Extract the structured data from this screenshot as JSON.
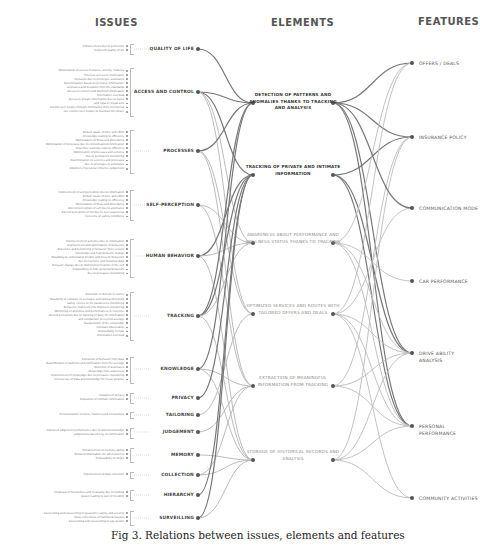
{
  "headers": {
    "issues": "ISSUES",
    "elements": "ELEMENTS",
    "features": "FEATURES"
  },
  "issues": [
    {
      "category": "QUALITY OF LIFE",
      "items": [
        "Enhancement due to perfection",
        "Improved quality of life"
      ]
    },
    {
      "category": "ACCESS AND CONTROL",
      "items": [
        "Optimization of access to places, activity, features",
        "Timeless access to information",
        "Exclusion due to privileges, anomalies",
        "Discrimination based on personal information,",
        "anomalies and deviation from the standards",
        "Access to content and distorted information",
        "Information overload",
        "Access to private information due to hacks",
        "and legal or illegal acts",
        "Control over people through information from monitoring",
        "Use control over people to maintain the power"
      ]
    },
    {
      "category": "PROCESSES",
      "items": [
        "Reduct waste of time and effort",
        "Knowledge leading to efficiency",
        "Optimization of flows and procedures",
        "Optimization of processes due to contextualized information",
        "Real time learning leads to efficiency",
        "Optimization of processes and services",
        "due to permanent monitoring",
        "Discrimination on services and processes",
        "due to privileges or anomalies",
        "Abolition of personal reflective judgement"
      ]
    },
    {
      "category": "SELF-PERCEPTION",
      "items": [
        "Improvement of self-perception due to information",
        "Reduct waste of time and effort",
        "Knowledge leading to efficiency",
        "Optimization of flows and procedures",
        "Altered perception of self due to anomalies",
        "Altered perception of life due to over awareness",
        "Concerns on safety conditions"
      ]
    },
    {
      "category": "HUMAN BEHAVIOR",
      "items": [
        "Improvement of activities due to information",
        "Improvement and optimization of behaviors",
        "Detection and monitoring of behavior from sensors",
        "knowledge and help behavior change",
        "Possibility to understand, predict and prevent behaviors",
        "due to real time and historical data",
        "Behavior change due to distorted perception of the self",
        "Impossibility to hide personal behaviors",
        "due to pervasive monitoring"
      ]
    },
    {
      "category": "TRACKING",
      "items": [
        "Detection of defects in carrier",
        "Possibility to compare to averages and optimal threshold",
        "Safety checks to life parameters monitoring",
        "Behaviors improvements thanks to monitoring",
        "Monitoring of activities and performances in real time",
        "Altered perception due to tracking of daily life information",
        "and comparison to leveled average",
        "Exasperation of the knowledge",
        "Constant observation",
        "Impossibility to hide",
        "Information overload"
      ]
    },
    {
      "category": "KNOWLEDGE",
      "items": [
        "Extraction of behavior from data",
        "Quantification of patterns and information from the average",
        "Detection of anomalies",
        "Knowledge from awareness",
        "Improvement of knowledge due to pervasive monitoring",
        "Unclear use of data and knowledge for mean purpose"
      ]
    },
    {
      "category": "PRIVACY",
      "items": [
        "Violation of privacy",
        "Exposition of intimate information"
      ]
    },
    {
      "category": "TAILORING",
      "items": [
        "Personalization of tours, features and interactions"
      ]
    },
    {
      "category": "JUDGEMENT",
      "items": [
        "Improved judgement performance due to stored knowledge",
        "Judgements based only on information"
      ]
    },
    {
      "category": "MEMORY",
      "items": [
        "Enhancement of memory ability",
        "Detailed information for old memories",
        "Impossibility to forget"
      ]
    },
    {
      "category": "COLLECTION",
      "items": [
        "Improvement of data collection"
      ]
    },
    {
      "category": "HIERARCHY",
      "items": [
        "Emphasis of hierarchies and inequality due to holding",
        "power leading to lack of freedom"
      ]
    },
    {
      "category": "SURVEILLING",
      "items": [
        "Sourveilling and sousveilling to guarantee safety and security",
        "Ideas corrections of harmful behaviors",
        "Sourveilling and sousveilling to spy people"
      ]
    }
  ],
  "elements": [
    {
      "label": "DETECTION OF PATTERNS AND ANOMALIES THANKS TO TRACKING AND ANALYSIS",
      "style": "strong"
    },
    {
      "label": "TRACKING OF PRIVATE AND INTIMATE INFORMATION",
      "style": "strong"
    },
    {
      "label": "AWARENESS ABOUT PERFORMANCE AND WELLNESS STATUS THANKS TO TRACKING",
      "style": "light"
    },
    {
      "label": "OPTIMIZED SERVICES AND ROUTES WITH TAILORED OFFERS AND DEALS",
      "style": "light"
    },
    {
      "label": "EXTRACTION OF MEANINGFUL INFORMATION FROM TRACKING",
      "style": "light"
    },
    {
      "label": "STORAGE OF HISTORICAL RECORDS AND ANALYSIS",
      "style": "light"
    }
  ],
  "features": [
    {
      "label": "OFFERS / DEALS"
    },
    {
      "label": "INSURANCE POLICY"
    },
    {
      "label": "COMMUNICATION MODE"
    },
    {
      "label": "CAR PERFORMANCE"
    },
    {
      "label": "DRIVE ABILITY ANALYSIS"
    },
    {
      "label": "PERSONAL PERFORMANCE"
    },
    {
      "label": "COMMUNITY ACTIVITIES"
    }
  ],
  "issue_element_links": [
    [
      0,
      0
    ],
    [
      1,
      0
    ],
    [
      1,
      1
    ],
    [
      1,
      2
    ],
    [
      1,
      3
    ],
    [
      2,
      0
    ],
    [
      2,
      3
    ],
    [
      2,
      4
    ],
    [
      3,
      2
    ],
    [
      3,
      4
    ],
    [
      4,
      1
    ],
    [
      4,
      2
    ],
    [
      4,
      5
    ],
    [
      5,
      0
    ],
    [
      5,
      1
    ],
    [
      5,
      2
    ],
    [
      5,
      5
    ],
    [
      6,
      0
    ],
    [
      6,
      4
    ],
    [
      6,
      5
    ],
    [
      7,
      1
    ],
    [
      8,
      3
    ],
    [
      9,
      4
    ],
    [
      10,
      5
    ],
    [
      11,
      5
    ],
    [
      11,
      4
    ],
    [
      12,
      1
    ],
    [
      13,
      1
    ],
    [
      13,
      5
    ]
  ],
  "element_feature_links": [
    [
      0,
      0
    ],
    [
      0,
      1
    ],
    [
      0,
      4
    ],
    [
      0,
      5
    ],
    [
      1,
      1
    ],
    [
      1,
      4
    ],
    [
      1,
      5
    ],
    [
      2,
      0
    ],
    [
      2,
      4
    ],
    [
      2,
      5
    ],
    [
      3,
      0
    ],
    [
      3,
      2
    ],
    [
      3,
      4
    ],
    [
      3,
      5
    ],
    [
      3,
      6
    ],
    [
      4,
      1
    ],
    [
      4,
      4
    ],
    [
      4,
      5
    ],
    [
      5,
      1
    ],
    [
      5,
      4
    ],
    [
      5,
      5
    ],
    [
      5,
      6
    ],
    [
      2,
      3
    ],
    [
      0,
      2
    ]
  ],
  "colors": {
    "strong_link": "#777777",
    "light_link": "#bbbbbb",
    "node": "#555555"
  },
  "caption": "Fig 3. Relations between issues, elements and features"
}
